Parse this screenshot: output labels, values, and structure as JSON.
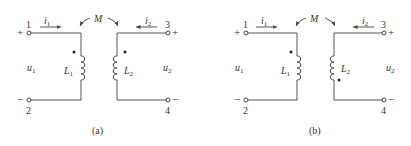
{
  "figures": [
    {
      "id": "a",
      "caption": "(a)",
      "mutual_label": "M",
      "L1_label": "L",
      "L1_sub": "1",
      "L2_label": "L",
      "L2_sub": "2",
      "i1_label": "i",
      "i1_sub": "1",
      "i2_label": "i",
      "i2_sub": "2",
      "u1_label": "u",
      "u1_sub": "1",
      "u2_label": "u",
      "u2_sub": "2",
      "terminals": [
        "1",
        "2",
        "3",
        "4"
      ],
      "plus": "+",
      "minus": "−",
      "dots": "L1 top, L2 top"
    },
    {
      "id": "b",
      "caption": "(b)",
      "mutual_label": "M",
      "L1_label": "L",
      "L1_sub": "1",
      "L2_label": "L",
      "L2_sub": "2",
      "i1_label": "i",
      "i1_sub": "1",
      "i2_label": "i",
      "i2_sub": "2",
      "u1_label": "u",
      "u1_sub": "1",
      "u2_label": "u",
      "u2_sub": "2",
      "terminals": [
        "1",
        "2",
        "3",
        "4"
      ],
      "plus": "+",
      "minus": "−",
      "dots": "L1 top, L2 bottom"
    }
  ]
}
